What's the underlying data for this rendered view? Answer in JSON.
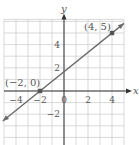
{
  "chart_data": {
    "type": "line",
    "title": "",
    "xlabel": "x",
    "ylabel": "y",
    "xlim": [
      -5,
      5
    ],
    "ylim": [
      -5,
      6
    ],
    "grid": true,
    "x_ticks": [
      -4,
      -2,
      0,
      2,
      4
    ],
    "x_tick_labels": [
      "−4",
      "−2",
      "0",
      "2",
      "4"
    ],
    "y_ticks": [
      -2,
      2,
      4
    ],
    "y_tick_labels": [
      "−2",
      "2",
      "4"
    ],
    "series": [
      {
        "name": "line",
        "equation": "y = (5/6)(x + 2)",
        "x": [
          -5,
          5
        ],
        "y": [
          -2.5,
          5.833
        ],
        "arrows": "both"
      }
    ],
    "points": [
      {
        "x": -2,
        "y": 0,
        "label": "(−2, 0)"
      },
      {
        "x": 4,
        "y": 5,
        "label": "(4, 5)"
      }
    ],
    "colors": {
      "line": "#6a6a6a",
      "grid": "#cfcfcf",
      "axis": "#333333",
      "point": "#555555",
      "text": "#555555"
    }
  }
}
